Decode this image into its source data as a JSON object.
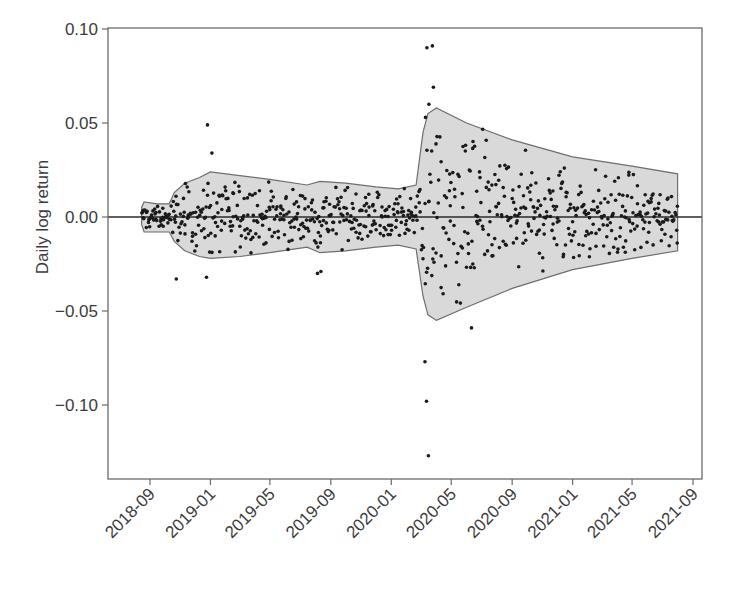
{
  "chart_data": {
    "type": "scatter",
    "title": "",
    "xlabel": "",
    "ylabel": "Daily log return",
    "ylim": [
      -0.138,
      0.1
    ],
    "xlim": [
      "2018-07-01",
      "2021-09-20"
    ],
    "grid": false,
    "legend": null,
    "y_ticks": [
      {
        "value": 0.1,
        "label": "0.10"
      },
      {
        "value": 0.05,
        "label": "0.05"
      },
      {
        "value": 0.0,
        "label": "0.00"
      },
      {
        "value": -0.05,
        "label": "−0.05"
      },
      {
        "value": -0.1,
        "label": "−0.10"
      }
    ],
    "x_ticks": [
      "2018-09",
      "2019-01",
      "2019-05",
      "2019-09",
      "2020-01",
      "2020-05",
      "2020-09",
      "2021-01",
      "2021-05",
      "2021-09"
    ],
    "zero_line": 0.0,
    "band": {
      "description": "Shaded conditional volatility envelope around zero",
      "fill": "#d9d9d9",
      "stroke": "#6e6e6e",
      "upper": [
        {
          "date": "2018-08-15",
          "value": 0.005
        },
        {
          "date": "2018-08-20",
          "value": 0.008
        },
        {
          "date": "2018-09-15",
          "value": 0.007
        },
        {
          "date": "2018-10-10",
          "value": 0.007
        },
        {
          "date": "2018-10-20",
          "value": 0.013
        },
        {
          "date": "2018-11-10",
          "value": 0.018
        },
        {
          "date": "2018-12-10",
          "value": 0.021
        },
        {
          "date": "2019-01-01",
          "value": 0.024
        },
        {
          "date": "2019-03-01",
          "value": 0.022
        },
        {
          "date": "2019-05-01",
          "value": 0.02
        },
        {
          "date": "2019-07-15",
          "value": 0.017
        },
        {
          "date": "2019-08-10",
          "value": 0.019
        },
        {
          "date": "2019-10-01",
          "value": 0.018
        },
        {
          "date": "2019-12-01",
          "value": 0.016
        },
        {
          "date": "2020-01-15",
          "value": 0.015
        },
        {
          "date": "2020-02-20",
          "value": 0.017
        },
        {
          "date": "2020-03-05",
          "value": 0.045
        },
        {
          "date": "2020-03-15",
          "value": 0.055
        },
        {
          "date": "2020-04-01",
          "value": 0.058
        },
        {
          "date": "2020-06-01",
          "value": 0.05
        },
        {
          "date": "2020-09-01",
          "value": 0.041
        },
        {
          "date": "2021-01-01",
          "value": 0.032
        },
        {
          "date": "2021-05-01",
          "value": 0.027
        },
        {
          "date": "2021-08-01",
          "value": 0.023
        }
      ],
      "lower": [
        {
          "date": "2018-08-15",
          "value": -0.004
        },
        {
          "date": "2018-08-20",
          "value": -0.008
        },
        {
          "date": "2018-09-15",
          "value": -0.008
        },
        {
          "date": "2018-10-10",
          "value": -0.008
        },
        {
          "date": "2018-10-20",
          "value": -0.013
        },
        {
          "date": "2018-11-10",
          "value": -0.018
        },
        {
          "date": "2018-12-10",
          "value": -0.021
        },
        {
          "date": "2019-01-01",
          "value": -0.022
        },
        {
          "date": "2019-03-01",
          "value": -0.021
        },
        {
          "date": "2019-05-01",
          "value": -0.019
        },
        {
          "date": "2019-07-15",
          "value": -0.016
        },
        {
          "date": "2019-08-10",
          "value": -0.019
        },
        {
          "date": "2019-10-01",
          "value": -0.018
        },
        {
          "date": "2019-12-01",
          "value": -0.016
        },
        {
          "date": "2020-01-15",
          "value": -0.015
        },
        {
          "date": "2020-02-20",
          "value": -0.017
        },
        {
          "date": "2020-03-05",
          "value": -0.042
        },
        {
          "date": "2020-03-15",
          "value": -0.052
        },
        {
          "date": "2020-04-01",
          "value": -0.055
        },
        {
          "date": "2020-06-01",
          "value": -0.048
        },
        {
          "date": "2020-09-01",
          "value": -0.038
        },
        {
          "date": "2021-01-01",
          "value": -0.028
        },
        {
          "date": "2021-05-01",
          "value": -0.022
        },
        {
          "date": "2021-08-01",
          "value": -0.018
        }
      ]
    },
    "series": [
      {
        "name": "Daily log return",
        "marker": "dot",
        "color": "#1a1a1a",
        "notable_points": [
          {
            "date": "2018-12-26",
            "value": 0.049
          },
          {
            "date": "2019-01-04",
            "value": 0.034
          },
          {
            "date": "2018-10-24",
            "value": -0.033
          },
          {
            "date": "2018-12-24",
            "value": -0.032
          },
          {
            "date": "2019-08-05",
            "value": -0.03
          },
          {
            "date": "2019-08-12",
            "value": -0.029
          },
          {
            "date": "2020-03-09",
            "value": -0.077
          },
          {
            "date": "2020-03-12",
            "value": -0.098
          },
          {
            "date": "2020-03-16",
            "value": -0.127
          },
          {
            "date": "2020-03-13",
            "value": 0.09
          },
          {
            "date": "2020-03-24",
            "value": 0.091
          },
          {
            "date": "2020-03-26",
            "value": 0.069
          },
          {
            "date": "2020-03-17",
            "value": 0.06
          },
          {
            "date": "2020-03-10",
            "value": 0.053
          },
          {
            "date": "2020-06-11",
            "value": -0.059
          }
        ],
        "bulk_description": "~750 daily observations clustered within the shaded band, mostly within ±0.02 except in the March–May 2020 high-volatility period"
      }
    ]
  }
}
